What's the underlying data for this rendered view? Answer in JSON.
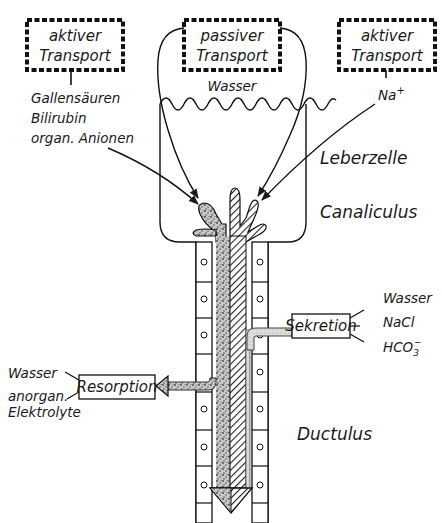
{
  "diagram": {
    "transport_boxes": [
      {
        "line1": "aktiver",
        "line2": "Transport"
      },
      {
        "line1": "passiver",
        "line2": "Transport"
      },
      {
        "line1": "aktiver",
        "line2": "Transport"
      }
    ],
    "left_substances": [
      "Gallensäuren",
      "Bilirubin",
      "organ. Anionen"
    ],
    "wasser_top": "Wasser",
    "na": "Na",
    "na_sup": "+",
    "region_labels": {
      "leberzelle": "Leberzelle",
      "canaliculus": "Canaliculus",
      "ductulus": "Ductulus"
    },
    "sekretion": {
      "label": "Sekretion",
      "items": [
        "Wasser",
        "NaCl",
        "HCO"
      ],
      "hco_sub": "3",
      "hco_sup": "−"
    },
    "resorption": {
      "label": "Resorption",
      "items": [
        "Wasser",
        "anorgan.",
        "Elektrolyte"
      ]
    }
  }
}
